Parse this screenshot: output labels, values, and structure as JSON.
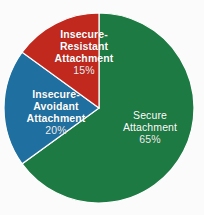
{
  "chart_data": {
    "type": "pie",
    "title": "",
    "subtitle": "",
    "xlabel": "",
    "ylabel": "",
    "legend_position": "none",
    "grid": false,
    "labels_inside": true,
    "start_angle_deg": 0,
    "direction": "clockwise",
    "categories": [
      "Secure Attachment",
      "Insecure-Avoidant Attachment",
      "Insecure-Resistant Attachment"
    ],
    "values": [
      65,
      20,
      15
    ],
    "value_unit": "%",
    "colors": [
      "#1d7a42",
      "#1f70a0",
      "#c1281e"
    ],
    "slices": [
      {
        "name": "Secure Attachment",
        "name_line1": "Secure",
        "name_line2": "Attachment",
        "value": 65,
        "value_label": "65%",
        "color": "#1d7a42",
        "sweep_deg": 234
      },
      {
        "name": "Insecure-Avoidant Attachment",
        "name_line1": "Insecure-",
        "name_line2": "Avoidant",
        "name_line3": "Attachment",
        "value": 20,
        "value_label": "20%",
        "color": "#1f70a0",
        "sweep_deg": 72
      },
      {
        "name": "Insecure-Resistant Attachment",
        "name_line1": "Insecure-",
        "name_line2": "Resistant",
        "name_line3": "Attachment",
        "value": 15,
        "value_label": "15%",
        "color": "#c1281e",
        "sweep_deg": 54
      }
    ]
  },
  "canvas": {
    "background_color": "#fbfbfb",
    "label_text_color": "#ffffff",
    "divider_color": "#ffffff"
  }
}
